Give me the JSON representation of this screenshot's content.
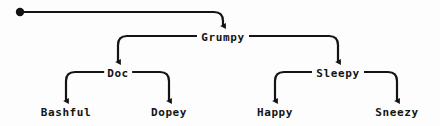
{
  "diagram": {
    "type": "tree",
    "title": "",
    "background_color": "#fdfdfd",
    "line_color": "#141414",
    "text_color": "#141414",
    "root_marker": "filled-dot",
    "nodes": [
      {
        "id": "grumpy",
        "label": "Grumpy",
        "level": 1,
        "x": 223,
        "y": 38
      },
      {
        "id": "doc",
        "label": "Doc",
        "level": 2,
        "x": 118,
        "y": 74
      },
      {
        "id": "sleepy",
        "label": "Sleepy",
        "level": 2,
        "x": 338,
        "y": 74
      },
      {
        "id": "bashful",
        "label": "Bashful",
        "level": 3,
        "x": 66,
        "y": 113
      },
      {
        "id": "dopey",
        "label": "Dopey",
        "level": 3,
        "x": 169,
        "y": 113
      },
      {
        "id": "happy",
        "label": "Happy",
        "level": 3,
        "x": 275,
        "y": 113
      },
      {
        "id": "sneezy",
        "label": "Sneezy",
        "level": 3,
        "x": 397,
        "y": 113
      }
    ],
    "edges": [
      {
        "from": "root",
        "to": "grumpy"
      },
      {
        "from": "grumpy",
        "to": "doc"
      },
      {
        "from": "grumpy",
        "to": "sleepy"
      },
      {
        "from": "doc",
        "to": "bashful"
      },
      {
        "from": "doc",
        "to": "dopey"
      },
      {
        "from": "sleepy",
        "to": "happy"
      },
      {
        "from": "sleepy",
        "to": "sneezy"
      }
    ]
  }
}
